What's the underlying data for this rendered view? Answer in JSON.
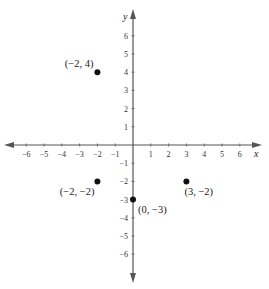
{
  "chart_data": {
    "type": "scatter",
    "title": "",
    "xlabel": "x",
    "ylabel": "y",
    "xlim": [
      -6,
      6
    ],
    "ylim": [
      -6,
      6
    ],
    "grid": false,
    "x_ticks": [
      -6,
      -5,
      -4,
      -3,
      -2,
      -1,
      1,
      2,
      3,
      4,
      5,
      6
    ],
    "y_ticks": [
      -6,
      -5,
      -4,
      -3,
      -2,
      -1,
      1,
      2,
      3,
      4,
      5,
      6
    ],
    "x_tick_labels": [
      "−6",
      "−5",
      "−4",
      "−3",
      "−2",
      "−1",
      "1",
      "2",
      "3",
      "4",
      "5",
      "6"
    ],
    "y_tick_labels": [
      "−6",
      "−5",
      "−4",
      "−3",
      "−2",
      "−1",
      "1",
      "2",
      "3",
      "4",
      "5",
      "6"
    ],
    "points": [
      {
        "x": -2,
        "y": 4,
        "label": "(−2, 4)"
      },
      {
        "x": -2,
        "y": -2,
        "label": "(−2, −2)"
      },
      {
        "x": 0,
        "y": -3,
        "label": "(0, −3)"
      },
      {
        "x": 3,
        "y": -2,
        "label": "(3, −2)"
      }
    ]
  },
  "colors": {
    "axis": "#555555",
    "point": "#111111",
    "text": "#222222"
  }
}
